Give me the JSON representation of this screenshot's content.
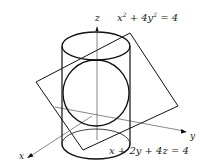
{
  "diagram": {
    "colors": {
      "stroke": "#111111",
      "axis": "#555555",
      "text": "#222222",
      "background": "#ffffff"
    },
    "labels": {
      "cylinder_equation": {
        "base": "x",
        "exp1": "2",
        "mid": " + 4y",
        "exp2": "2",
        "tail": " = 4"
      },
      "plane_equation": "x + 2y + 4z = 4",
      "axis_x": "x",
      "axis_y": "y",
      "axis_z": "z"
    },
    "elements": [
      "cylinder",
      "plane",
      "intersection-ellipse",
      "x-axis",
      "y-axis",
      "z-axis"
    ]
  }
}
